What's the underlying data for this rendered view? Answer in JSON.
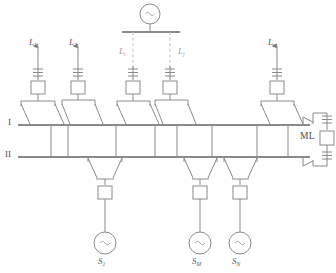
{
  "diagram": {
    "colors": {
      "line": "#8a8a8a",
      "line_dim": "#b9b9b9",
      "bus": "#8a8a8a",
      "text": "#5a5a5a",
      "text_dim": "#9a9a9a",
      "background": "#ffffff"
    }
  },
  "buses": [
    {
      "name": "bus-i",
      "label": "I",
      "label_x": 8,
      "label_y": 119
    },
    {
      "name": "bus-ii",
      "label": "II",
      "label_x": 6,
      "label_y": 151
    }
  ],
  "top_source": {
    "name": "top-ac-source",
    "symbol": "~",
    "cx": 150,
    "cy": 14,
    "r": 10
  },
  "tie_bay": {
    "name": "bus-tie-ml",
    "label": "ML"
  },
  "line_feeders": [
    {
      "name": "feeder-l1",
      "label": "L",
      "sub": "1",
      "x": 38,
      "label_x": 29,
      "label_y": 41,
      "dim": false,
      "arrow": true
    },
    {
      "name": "feeder-l2",
      "label": "L",
      "sub": "2",
      "x": 78,
      "label_x": 69,
      "label_y": 41,
      "dim": false,
      "arrow": true
    },
    {
      "name": "feeder-li",
      "label": "L",
      "sub": "i",
      "x": 133,
      "label_x": 119,
      "label_y": 50,
      "dim": true,
      "arrow": false
    },
    {
      "name": "feeder-lj",
      "label": "L",
      "sub": "j",
      "x": 170,
      "label_x": 178,
      "label_y": 50,
      "dim": true,
      "arrow": false
    },
    {
      "name": "feeder-ln",
      "label": "L",
      "sub": "n",
      "x": 277,
      "label_x": 268,
      "label_y": 41,
      "dim": false,
      "arrow": true
    }
  ],
  "source_bays": [
    {
      "name": "source-s1",
      "label": "S",
      "sub": "1",
      "x": 105,
      "label_x": 98,
      "label_y": 263,
      "symbol": "~"
    },
    {
      "name": "source-sm",
      "label": "S",
      "sub": "M",
      "x": 200,
      "label_x": 192,
      "label_y": 263,
      "symbol": "~"
    },
    {
      "name": "source-sn",
      "label": "S",
      "sub": "N",
      "x": 240,
      "label_x": 233,
      "label_y": 263,
      "symbol": "~"
    }
  ]
}
